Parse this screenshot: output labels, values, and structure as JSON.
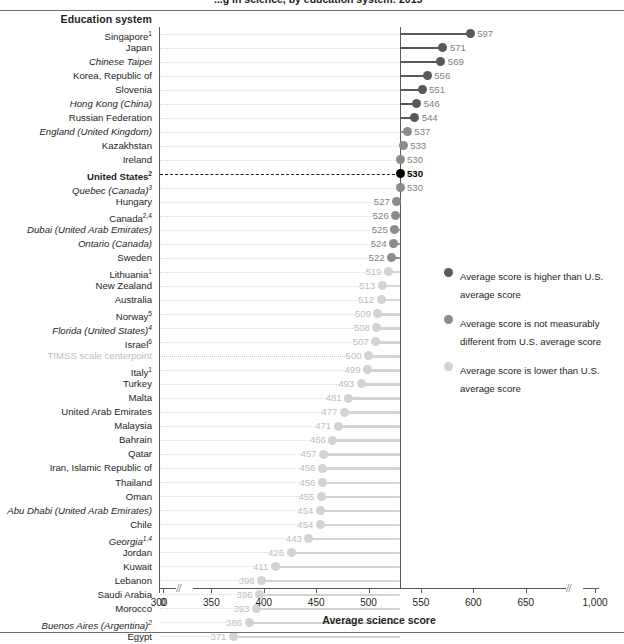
{
  "header": {
    "title_clipped": "...g in science, by education system: 2015",
    "column_header": "Education system"
  },
  "legend": {
    "items": [
      {
        "color": "#595959",
        "text": "Average score is higher than U.S. average score"
      },
      {
        "color": "#8c8c8c",
        "text": "Average score is not measurably different from U.S. average score"
      },
      {
        "color": "#d2d3d4",
        "text": "Average score is lower than U.S. average score"
      }
    ]
  },
  "axis": {
    "title": "Average science score",
    "ticks": [
      "0",
      "300",
      "350",
      "400",
      "450",
      "500",
      "550",
      "600",
      "650",
      "1,000"
    ],
    "break_marks": [
      "//",
      "//"
    ]
  },
  "chart_data": {
    "type": "bar",
    "orientation": "horizontal",
    "xlabel": "Average science score",
    "ylabel": "Education system",
    "xlim": [
      300,
      650
    ],
    "axis_break": true,
    "grid": false,
    "reference_line": {
      "label": "United States",
      "value": 530
    },
    "legend_position": "right",
    "categories": [
      "Singapore",
      "Japan",
      "Chinese Taipei",
      "Korea, Republic of",
      "Slovenia",
      "Hong Kong (China)",
      "Russian Federation",
      "England (United Kingdom)",
      "Kazakhstan",
      "Ireland",
      "United States",
      "Quebec (Canada)",
      "Hungary",
      "Canada",
      "Dubai (United Arab Emirates)",
      "Ontario (Canada)",
      "Sweden",
      "Lithuania",
      "New Zealand",
      "Australia",
      "Norway",
      "Florida (United States)",
      "Israel",
      "TIMSS scale centerpoint",
      "Italy",
      "Turkey",
      "Malta",
      "United Arab Emirates",
      "Malaysia",
      "Bahrain",
      "Qatar",
      "Iran, Islamic Republic of",
      "Thailand",
      "Oman",
      "Abu Dhabi (United Arab Emirates)",
      "Chile",
      "Georgia",
      "Jordan",
      "Kuwait",
      "Lebanon",
      "Saudi Arabia",
      "Morocco",
      "Buenos Aires (Argentina)",
      "Egypt"
    ],
    "values": [
      597,
      571,
      569,
      556,
      551,
      546,
      544,
      537,
      533,
      530,
      530,
      530,
      527,
      526,
      525,
      524,
      522,
      519,
      513,
      512,
      509,
      508,
      507,
      500,
      499,
      493,
      481,
      477,
      471,
      466,
      457,
      456,
      456,
      455,
      454,
      454,
      443,
      426,
      411,
      398,
      396,
      393,
      386,
      371
    ]
  },
  "rows": [
    {
      "label": "Singapore",
      "sup": "1",
      "value": "597",
      "v": 597,
      "cat": "higher",
      "italic": false,
      "kind": "normal"
    },
    {
      "label": "Japan",
      "sup": "",
      "value": "571",
      "v": 571,
      "cat": "higher",
      "italic": false,
      "kind": "normal"
    },
    {
      "label": "Chinese Taipei",
      "sup": "",
      "value": "569",
      "v": 569,
      "cat": "higher",
      "italic": true,
      "kind": "normal"
    },
    {
      "label": "Korea, Republic of",
      "sup": "",
      "value": "556",
      "v": 556,
      "cat": "higher",
      "italic": false,
      "kind": "normal"
    },
    {
      "label": "Slovenia",
      "sup": "",
      "value": "551",
      "v": 551,
      "cat": "higher",
      "italic": false,
      "kind": "normal"
    },
    {
      "label": "Hong Kong (China)",
      "sup": "",
      "value": "546",
      "v": 546,
      "cat": "higher",
      "italic": true,
      "kind": "normal"
    },
    {
      "label": "Russian Federation",
      "sup": "",
      "value": "544",
      "v": 544,
      "cat": "higher",
      "italic": false,
      "kind": "normal"
    },
    {
      "label": "England (United Kingdom)",
      "sup": "",
      "value": "537",
      "v": 537,
      "cat": "same",
      "italic": true,
      "kind": "normal"
    },
    {
      "label": "Kazakhstan",
      "sup": "",
      "value": "533",
      "v": 533,
      "cat": "same",
      "italic": false,
      "kind": "normal"
    },
    {
      "label": "Ireland",
      "sup": "",
      "value": "530",
      "v": 530,
      "cat": "same",
      "italic": false,
      "kind": "normal"
    },
    {
      "label": "United States",
      "sup": "2",
      "value": "530",
      "v": 530,
      "cat": "us",
      "italic": false,
      "kind": "us"
    },
    {
      "label": "Quebec (Canada)",
      "sup": "3",
      "value": "530",
      "v": 530,
      "cat": "same",
      "italic": true,
      "kind": "normal"
    },
    {
      "label": "Hungary",
      "sup": "",
      "value": "527",
      "v": 527,
      "cat": "same",
      "italic": false,
      "kind": "normal"
    },
    {
      "label": "Canada",
      "sup": "2,4",
      "value": "526",
      "v": 526,
      "cat": "same",
      "italic": false,
      "kind": "normal"
    },
    {
      "label": "Dubai (United Arab Emirates)",
      "sup": "",
      "value": "525",
      "v": 525,
      "cat": "same",
      "italic": true,
      "kind": "normal"
    },
    {
      "label": "Ontario (Canada)",
      "sup": "",
      "value": "524",
      "v": 524,
      "cat": "same",
      "italic": true,
      "kind": "normal"
    },
    {
      "label": "Sweden",
      "sup": "",
      "value": "522",
      "v": 522,
      "cat": "same",
      "italic": false,
      "kind": "normal"
    },
    {
      "label": "Lithuania",
      "sup": "1",
      "value": "519",
      "v": 519,
      "cat": "lower",
      "italic": false,
      "kind": "normal"
    },
    {
      "label": "New Zealand",
      "sup": "",
      "value": "513",
      "v": 513,
      "cat": "lower",
      "italic": false,
      "kind": "normal"
    },
    {
      "label": "Australia",
      "sup": "",
      "value": "512",
      "v": 512,
      "cat": "lower",
      "italic": false,
      "kind": "normal"
    },
    {
      "label": "Norway",
      "sup": "5",
      "value": "509",
      "v": 509,
      "cat": "lower",
      "italic": false,
      "kind": "normal"
    },
    {
      "label": "Florida (United States)",
      "sup": "4",
      "value": "508",
      "v": 508,
      "cat": "lower",
      "italic": true,
      "kind": "normal"
    },
    {
      "label": "Israel",
      "sup": "6",
      "value": "507",
      "v": 507,
      "cat": "lower",
      "italic": false,
      "kind": "normal"
    },
    {
      "label": "TIMSS scale centerpoint",
      "sup": "",
      "value": "500",
      "v": 500,
      "cat": "center",
      "italic": false,
      "kind": "center"
    },
    {
      "label": "Italy",
      "sup": "1",
      "value": "499",
      "v": 499,
      "cat": "lower",
      "italic": false,
      "kind": "normal"
    },
    {
      "label": "Turkey",
      "sup": "",
      "value": "493",
      "v": 493,
      "cat": "lower",
      "italic": false,
      "kind": "normal"
    },
    {
      "label": "Malta",
      "sup": "",
      "value": "481",
      "v": 481,
      "cat": "lower",
      "italic": false,
      "kind": "normal"
    },
    {
      "label": "United Arab Emirates",
      "sup": "",
      "value": "477",
      "v": 477,
      "cat": "lower",
      "italic": false,
      "kind": "normal"
    },
    {
      "label": "Malaysia",
      "sup": "",
      "value": "471",
      "v": 471,
      "cat": "lower",
      "italic": false,
      "kind": "normal"
    },
    {
      "label": "Bahrain",
      "sup": "",
      "value": "466",
      "v": 466,
      "cat": "lower",
      "italic": false,
      "kind": "normal"
    },
    {
      "label": "Qatar",
      "sup": "",
      "value": "457",
      "v": 457,
      "cat": "lower",
      "italic": false,
      "kind": "normal"
    },
    {
      "label": "Iran, Islamic Republic of",
      "sup": "",
      "value": "456",
      "v": 456,
      "cat": "lower",
      "italic": false,
      "kind": "normal"
    },
    {
      "label": "Thailand",
      "sup": "",
      "value": "456",
      "v": 456,
      "cat": "lower",
      "italic": false,
      "kind": "normal"
    },
    {
      "label": "Oman",
      "sup": "",
      "value": "455",
      "v": 455,
      "cat": "lower",
      "italic": false,
      "kind": "normal"
    },
    {
      "label": "Abu Dhabi (United Arab Emirates)",
      "sup": "",
      "value": "454",
      "v": 454,
      "cat": "lower",
      "italic": true,
      "kind": "normal"
    },
    {
      "label": "Chile",
      "sup": "",
      "value": "454",
      "v": 454,
      "cat": "lower",
      "italic": false,
      "kind": "normal"
    },
    {
      "label": "Georgia",
      "sup": "1,4",
      "value": "443",
      "v": 443,
      "cat": "lower",
      "italic": true,
      "kind": "normal"
    },
    {
      "label": "Jordan",
      "sup": "",
      "value": "426",
      "v": 426,
      "cat": "lower",
      "italic": false,
      "kind": "normal"
    },
    {
      "label": "Kuwait",
      "sup": "",
      "value": "411",
      "v": 411,
      "cat": "lower",
      "italic": false,
      "kind": "normal"
    },
    {
      "label": "Lebanon",
      "sup": "",
      "value": "398",
      "v": 398,
      "cat": "lower",
      "italic": false,
      "kind": "normal"
    },
    {
      "label": "Saudi Arabia",
      "sup": "",
      "value": "396",
      "v": 396,
      "cat": "lower",
      "italic": false,
      "kind": "normal"
    },
    {
      "label": "Morocco",
      "sup": "",
      "value": "393",
      "v": 393,
      "cat": "lower",
      "italic": false,
      "kind": "normal"
    },
    {
      "label": "Buenos Aires (Argentina)",
      "sup": "2",
      "value": "386",
      "v": 386,
      "cat": "lower",
      "italic": true,
      "kind": "normal"
    },
    {
      "label": "Egypt",
      "sup": "",
      "value": "371",
      "v": 371,
      "cat": "lower",
      "italic": false,
      "kind": "normal"
    }
  ],
  "colors": {
    "higher": "#595959",
    "same": "#8c8c8c",
    "lower": "#d2d3d4",
    "us": "#000000",
    "center": "#d2d3d4"
  }
}
